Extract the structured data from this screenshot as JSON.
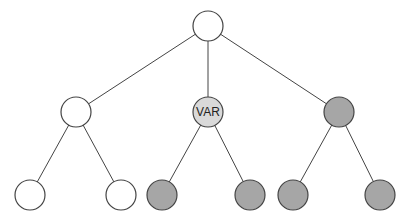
{
  "diagram": {
    "type": "tree",
    "colors": {
      "white": "#ffffff",
      "gray": "#a6a6a6",
      "light_gray": "#d9d9d9",
      "stroke": "#444444"
    },
    "nodes": [
      {
        "id": "root",
        "x": 208,
        "y": 26,
        "fill": "white",
        "label": ""
      },
      {
        "id": "mid-left",
        "x": 76,
        "y": 112,
        "fill": "white",
        "label": ""
      },
      {
        "id": "mid-center",
        "x": 208,
        "y": 112,
        "fill": "light_gray",
        "label": "VAR"
      },
      {
        "id": "mid-right",
        "x": 339,
        "y": 112,
        "fill": "gray",
        "label": ""
      },
      {
        "id": "leaf-1",
        "x": 30,
        "y": 195,
        "fill": "white",
        "label": ""
      },
      {
        "id": "leaf-2",
        "x": 121,
        "y": 195,
        "fill": "white",
        "label": ""
      },
      {
        "id": "leaf-3",
        "x": 162,
        "y": 195,
        "fill": "gray",
        "label": ""
      },
      {
        "id": "leaf-4",
        "x": 250,
        "y": 195,
        "fill": "gray",
        "label": ""
      },
      {
        "id": "leaf-5",
        "x": 293,
        "y": 195,
        "fill": "gray",
        "label": ""
      },
      {
        "id": "leaf-6",
        "x": 380,
        "y": 195,
        "fill": "gray",
        "label": ""
      }
    ],
    "edges": [
      [
        "root",
        "mid-left"
      ],
      [
        "root",
        "mid-center"
      ],
      [
        "root",
        "mid-right"
      ],
      [
        "mid-left",
        "leaf-1"
      ],
      [
        "mid-left",
        "leaf-2"
      ],
      [
        "mid-center",
        "leaf-3"
      ],
      [
        "mid-center",
        "leaf-4"
      ],
      [
        "mid-right",
        "leaf-5"
      ],
      [
        "mid-right",
        "leaf-6"
      ]
    ],
    "radius": 15
  }
}
